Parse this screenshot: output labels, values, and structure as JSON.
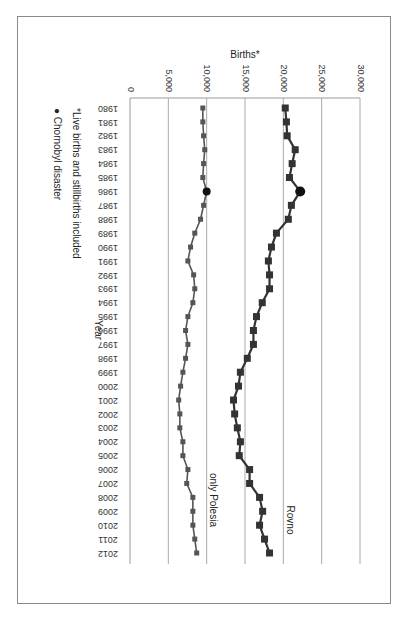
{
  "chart_data": {
    "type": "line",
    "orientation": "rotated 90 degrees (x-axis runs top to bottom, y-axis left to right)",
    "title": "",
    "xlabel": "Year",
    "ylabel": "Births*",
    "ylim": [
      0,
      30000
    ],
    "yticks": [
      "0",
      "5,000",
      "10,000",
      "15,000",
      "20,000",
      "25,000",
      "30,000"
    ],
    "grid": true,
    "categories": [
      "1980",
      "1981",
      "1982",
      "1983",
      "1984",
      "1985",
      "1986",
      "1987",
      "1988",
      "1989",
      "1990",
      "1991",
      "1992",
      "1993",
      "1994",
      "1995",
      "1996",
      "1997",
      "1998",
      "1999",
      "2000",
      "2001",
      "2002",
      "2003",
      "2004",
      "2005",
      "2006",
      "2007",
      "2008",
      "2009",
      "2010",
      "2011",
      "2012"
    ],
    "series": [
      {
        "name": "Rovno",
        "color": "#333333",
        "values": [
          20250,
          20400,
          20500,
          21550,
          21150,
          20800,
          22200,
          21050,
          20650,
          19100,
          18450,
          18050,
          18200,
          18200,
          17250,
          16500,
          16100,
          16100,
          15300,
          14400,
          14150,
          13500,
          13650,
          14000,
          14400,
          14250,
          15600,
          15600,
          16900,
          17300,
          16900,
          17550,
          18200
        ]
      },
      {
        "name": "only Polesia",
        "color": "#555555",
        "values": [
          9500,
          9500,
          9600,
          9750,
          9600,
          9500,
          10000,
          9600,
          9200,
          8450,
          7900,
          7550,
          8300,
          8450,
          8200,
          7550,
          7250,
          7550,
          7250,
          6900,
          6600,
          6350,
          6500,
          6500,
          6900,
          6900,
          7550,
          7400,
          8200,
          8200,
          8200,
          8450,
          8700
        ]
      }
    ],
    "markers": {
      "chornobyl_year": "1986",
      "style": "large black circle"
    },
    "legend": [
      {
        "symbol": "*",
        "text": "Live births and stillbirths included"
      },
      {
        "symbol": "●",
        "text": "Chornobyl disaster"
      }
    ],
    "series_labels": {
      "rovno": "Rovno",
      "polesia": "only Polesia"
    }
  },
  "axis": {
    "y_title": "Births*",
    "x_title": "Year"
  },
  "notes": {
    "footnote": "*Live births and stillbirths included",
    "chornobyl": "Chornobyl disaster",
    "chornobyl_symbol": "●"
  }
}
